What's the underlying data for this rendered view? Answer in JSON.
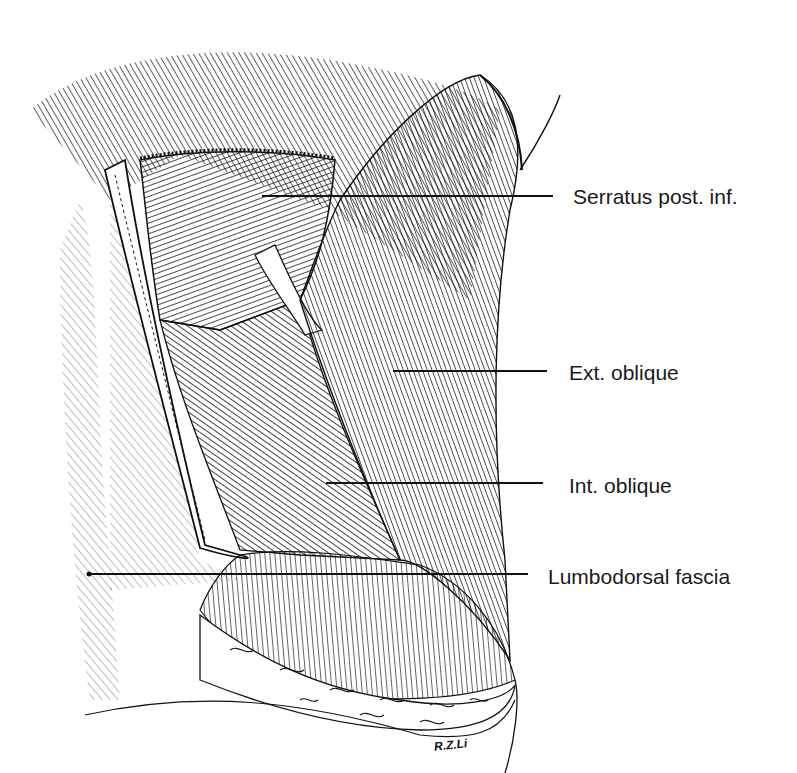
{
  "figure": {
    "type": "anatomical illustration",
    "style": "pen-and-ink line drawing, black on white",
    "colors": {
      "ink": "#111111",
      "background": "#ffffff",
      "label_text": "#1a1a1a"
    },
    "signature": "R.Z.Li"
  },
  "labels": [
    {
      "id": "serratus",
      "text": "Serratus post. inf.",
      "text_x": 573,
      "text_y": 186,
      "line": [
        262,
        196,
        553,
        196
      ]
    },
    {
      "id": "ext-oblique",
      "text": "Ext. oblique",
      "text_x": 569,
      "text_y": 362,
      "line": [
        393,
        371,
        547,
        371
      ]
    },
    {
      "id": "int-oblique",
      "text": "Int. oblique",
      "text_x": 569,
      "text_y": 475,
      "line": [
        326,
        483,
        543,
        483
      ]
    },
    {
      "id": "lumbodorsal",
      "text": "Lumbodorsal fascia",
      "text_x": 548,
      "text_y": 566,
      "line": [
        89,
        574,
        528,
        574
      ]
    }
  ]
}
